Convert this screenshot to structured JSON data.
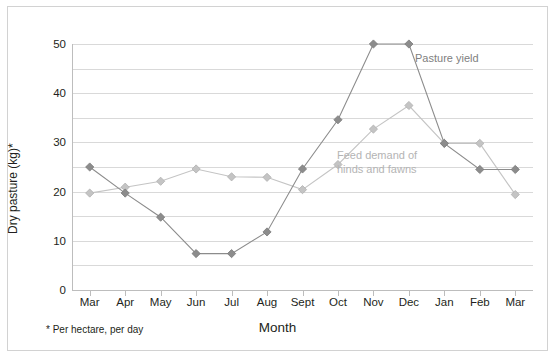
{
  "chart_data": {
    "type": "line",
    "title": "",
    "xlabel": "Month",
    "ylabel": "Dry pasture (kg)*",
    "footnote": "* Per hectare, per day",
    "categories": [
      "Mar",
      "Apr",
      "May",
      "Jun",
      "Jul",
      "Aug",
      "Sept",
      "Oct",
      "Nov",
      "Dec",
      "Jan",
      "Feb",
      "Mar"
    ],
    "ylim": [
      0,
      50
    ],
    "yticks": [
      0,
      10,
      20,
      30,
      40,
      50
    ],
    "gridlines": [
      0,
      5,
      10,
      15,
      20,
      25,
      30,
      35,
      40,
      45,
      50
    ],
    "grid": true,
    "legend_position": "inline-annotations",
    "series": [
      {
        "name": "Pasture yield",
        "color": "#8c8c8c",
        "marker": "diamond",
        "values": [
          25,
          19.7,
          14.8,
          7.4,
          7.4,
          11.8,
          24.6,
          34.6,
          50,
          50,
          29.8,
          24.5,
          24.5
        ]
      },
      {
        "name": "Feed demand of hinds and fawns",
        "color": "#c4c4c4",
        "marker": "diamond",
        "values": [
          19.7,
          20.9,
          22.1,
          24.6,
          23.0,
          22.9,
          20.4,
          25.5,
          32.7,
          37.5,
          29.8,
          29.8,
          19.4
        ]
      }
    ],
    "annotations": [
      {
        "text": "Pasture yield",
        "series": "Pasture yield"
      },
      {
        "text_line1": "Feed demand of",
        "text_line2": "hinds and fawns",
        "series": "Feed demand of hinds and fawns"
      }
    ]
  },
  "colors": {
    "pasture_yield": "#8c8c8c",
    "feed_demand": "#c4c4c4",
    "grid": "#d9d9d9",
    "axis": "#bdbdbd",
    "frame": "#d2d2d2",
    "text": "#231f20"
  }
}
